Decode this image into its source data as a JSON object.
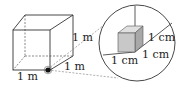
{
  "diagram": {
    "big_cube": {
      "edge_labels": [
        "1 m",
        "1 m",
        "1 m"
      ]
    },
    "magnified_view": {
      "edge_labels": [
        "1 cm",
        "1 cm",
        "1 cm"
      ]
    },
    "colors": {
      "line": "#333333",
      "small_cube_front": "#c8c8c8",
      "small_cube_top": "#e0e0e0",
      "small_cube_side": "#a8a8a8",
      "dot": "#111111"
    }
  }
}
